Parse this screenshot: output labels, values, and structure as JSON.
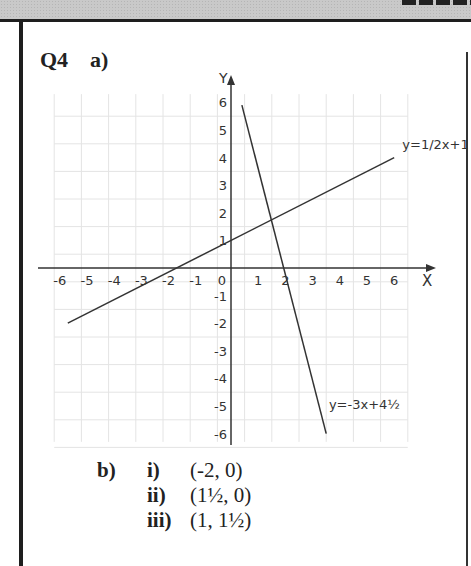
{
  "question": {
    "number": "Q4",
    "part_a_label": "a)",
    "part_b_label": "b)",
    "answers": [
      {
        "label": "i)",
        "value": "(-2, 0)"
      },
      {
        "label": "ii)",
        "value": "(1½, 0)"
      },
      {
        "label": "iii)",
        "value": "(1, 1½)"
      }
    ]
  },
  "chart_data": {
    "type": "line",
    "title": "",
    "xlabel": "X",
    "ylabel": "Y",
    "xlim": [
      -6.5,
      6.5
    ],
    "ylim": [
      -6.3,
      6.5
    ],
    "grid": true,
    "x_ticks": [
      "-6",
      "-5",
      "-4",
      "-3",
      "-2",
      "-1",
      "0",
      "1",
      "2",
      "3",
      "4",
      "5",
      "6"
    ],
    "y_ticks": [
      "-6",
      "-5",
      "-4",
      "-3",
      "-2",
      "-1",
      "1",
      "2",
      "3",
      "4",
      "5",
      "6"
    ],
    "series": [
      {
        "name": "y=1/2x+1",
        "x": [
          -6,
          6
        ],
        "y": [
          -2,
          4
        ]
      },
      {
        "name": "y=-3x+4½",
        "x": [
          0.4,
          3.5
        ],
        "y": [
          5.9,
          -6
        ]
      }
    ],
    "annotations": [
      {
        "text": "y=1/2x+1",
        "x": 6.3,
        "y": 4.3
      },
      {
        "text": "y=-3x+4½",
        "x": 3.6,
        "y": -5.1
      }
    ],
    "intersections": [
      {
        "x": -2,
        "y": 0
      },
      {
        "x": 1.5,
        "y": 0
      },
      {
        "x": 1,
        "y": 1.5
      }
    ]
  }
}
